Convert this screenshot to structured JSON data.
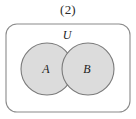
{
  "figure": {
    "caption": "(2)",
    "type": "venn-diagram-two-sets-intersecting",
    "background_color": "#ffffff"
  },
  "universe": {
    "label": "U",
    "shape": "rounded-rectangle",
    "stroke_color": "#8a8a8a",
    "fill_color": "none",
    "x": 6,
    "y": 24,
    "width": 124,
    "height": 88,
    "corner_radius": 11,
    "stroke_width": 1.1,
    "label_x": 67,
    "label_y": 39
  },
  "sets": [
    {
      "label": "A",
      "shape": "circle",
      "cx": 47,
      "cy": 69,
      "r": 26,
      "fill_color": "#dcdcdc",
      "stroke_color": "#7a7a7a",
      "stroke_width": 1.1,
      "label_x": 46,
      "label_y": 73
    },
    {
      "label": "B",
      "shape": "circle",
      "cx": 88,
      "cy": 69,
      "r": 26,
      "fill_color": "#dcdcdc",
      "stroke_color": "#7a7a7a",
      "stroke_width": 1.1,
      "label_x": 87,
      "label_y": 73
    }
  ],
  "intersection": {
    "present": true,
    "description": "lens-shaped overlap of A and B",
    "fill_color": "#dcdcdc"
  }
}
